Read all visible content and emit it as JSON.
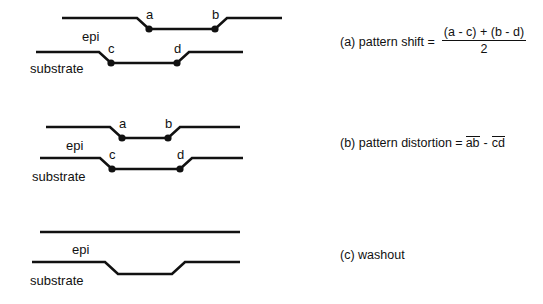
{
  "figure": {
    "background_color": "#ffffff",
    "line_color": "#111111",
    "panels": [
      {
        "id": "a",
        "caption_lead": "(a) pattern shift =",
        "formula": {
          "numerator": "(a - c) + (b - d)",
          "denominator": "2"
        },
        "layer_labels": {
          "epi": "epi",
          "substrate": "substrate"
        },
        "point_labels": [
          "a",
          "b",
          "c",
          "d"
        ],
        "description": "epi surface step displaced laterally relative to substrate step"
      },
      {
        "id": "b",
        "caption_lead": "(b) pattern distortion =",
        "formula": {
          "term_1": "ab",
          "operator": "-",
          "term_2": "cd"
        },
        "layer_labels": {
          "epi": "epi",
          "substrate": "substrate"
        },
        "point_labels": [
          "a",
          "b",
          "c",
          "d"
        ],
        "description": "epi surface step narrower than substrate step"
      },
      {
        "id": "c",
        "caption_lead": "(c) washout",
        "layer_labels": {
          "epi": "epi",
          "substrate": "substrate"
        },
        "point_labels": [],
        "description": "epi surface flat, substrate step not transferred"
      }
    ]
  }
}
